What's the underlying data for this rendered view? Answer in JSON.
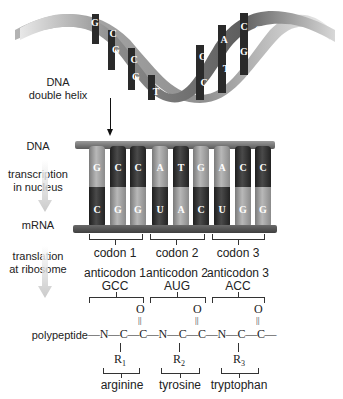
{
  "labels": {
    "dna_double_helix_1": "DNA",
    "dna_double_helix_2": "double helix",
    "dna": "DNA",
    "transcription_1": "transcription",
    "transcription_2": "in nucleus",
    "mrna": "mRNA",
    "translation_1": "translation",
    "translation_2": "at ribosome",
    "polypeptide": "polypeptide"
  },
  "helix": {
    "left_letters": [
      "G",
      "C",
      "G",
      "C",
      "G",
      "T"
    ],
    "right_letters": [
      "T",
      "G",
      "C",
      "A",
      "T",
      "C",
      "G",
      "G"
    ]
  },
  "dna_strand": [
    "G",
    "C",
    "C",
    "A",
    "T",
    "G",
    "A",
    "C",
    "C"
  ],
  "mrna_strand": [
    "C",
    "G",
    "G",
    "U",
    "A",
    "C",
    "U",
    "G",
    "G"
  ],
  "codons": [
    "codon 1",
    "codon 2",
    "codon 3"
  ],
  "anticodons": [
    {
      "label": "anticodon 1",
      "seq": "GCC"
    },
    {
      "label": "anticodon 2",
      "seq": "AUG"
    },
    {
      "label": "anticodon 3",
      "seq": "ACC"
    }
  ],
  "peptide": {
    "O": "O",
    "double_bond": "||",
    "chain": "—N—C—C—N—C—C—N—C—C—",
    "r_groups": [
      {
        "R": "R",
        "sub": "1"
      },
      {
        "R": "R",
        "sub": "2"
      },
      {
        "R": "R",
        "sub": "3"
      }
    ]
  },
  "amino_acids": [
    "arginine",
    "tyrosine",
    "tryptophan"
  ],
  "colors": {
    "light_bar": "#9a9a9a",
    "dark_bar": "#2a2a2a",
    "text": "#222222",
    "arrow_fade": "#c8c8c8"
  }
}
